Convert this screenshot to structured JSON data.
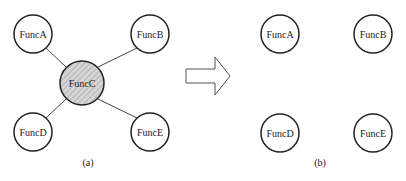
{
  "panel_a": {
    "caption": "(a)",
    "center": {
      "label": "FuncC",
      "x": 82,
      "y": 83,
      "r": 22
    },
    "nodes": [
      {
        "label": "FuncA",
        "x": 33,
        "y": 34,
        "r": 19
      },
      {
        "label": "FuncB",
        "x": 150,
        "y": 34,
        "r": 19
      },
      {
        "label": "FuncD",
        "x": 33,
        "y": 132,
        "r": 19
      },
      {
        "label": "FuncE",
        "x": 150,
        "y": 132,
        "r": 19
      }
    ]
  },
  "panel_b": {
    "caption": "(b)",
    "nodes": [
      {
        "label": "FuncA",
        "x": 280,
        "y": 34,
        "r": 19
      },
      {
        "label": "FuncB",
        "x": 373,
        "y": 34,
        "r": 19
      },
      {
        "label": "FuncD",
        "x": 280,
        "y": 133,
        "r": 19
      },
      {
        "label": "FuncE",
        "x": 373,
        "y": 133,
        "r": 19
      }
    ]
  },
  "arrow": {
    "direction": "right"
  },
  "colors": {
    "stroke": "#222222",
    "center_fill": "#d6d6d6",
    "hatch": "#a8a8a8"
  }
}
